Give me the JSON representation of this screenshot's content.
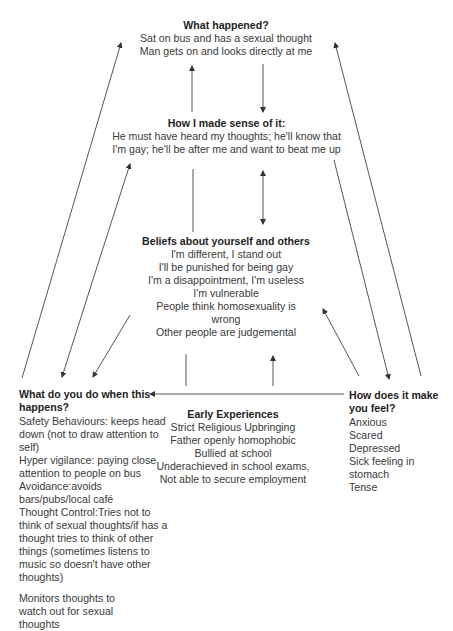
{
  "diagram": {
    "what_happened": {
      "title": "What happened?",
      "lines": [
        "Sat on bus and has a sexual thought",
        "Man gets on and looks directly at me"
      ]
    },
    "sense": {
      "title": "How I made sense of it:",
      "lines": [
        "He must have heard my thoughts; he'll know that",
        "I'm gay; he'll be after me and want to beat me up"
      ]
    },
    "beliefs": {
      "title": "Beliefs about yourself and others",
      "lines": [
        "I'm different, I stand out",
        "I'll be punished for being gay",
        "I'm a disappointment, I'm useless",
        "I'm vulnerable",
        "People think homosexuality is",
        "wrong",
        "Other people are judgemental"
      ]
    },
    "behaviour": {
      "title_line1": "What do you do when this",
      "title_line2": "happens?",
      "items": [
        "Safety Behaviours: keeps head down (not to draw attention to self)",
        "Hyper vigilance: paying close attention to people on bus",
        "Avoidance:avoids bars/pubs/local café",
        "Thought Control:Tries not to think of sexual thoughts/if has a thought tries to think of other things (sometimes listens to music so doesn't have other thoughts)",
        "Monitors thoughts to watch out for sexual thoughts"
      ]
    },
    "early": {
      "title": "Early Experiences",
      "lines": [
        "Strict Religious Upbringing",
        "Father openly homophobic",
        "Bullied at school",
        "Underachieved in school exams,",
        "Not able to secure employment"
      ]
    },
    "feel": {
      "title_line1": "How does it make",
      "title_line2": "you feel?",
      "items": [
        "Anxious",
        "Scared",
        "Depressed",
        "Sick feeling in stomach",
        "Tense"
      ]
    }
  }
}
